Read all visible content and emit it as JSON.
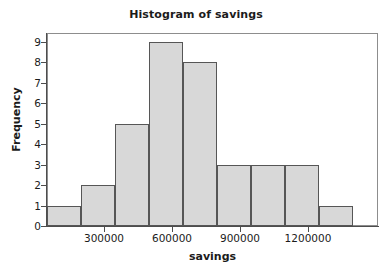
{
  "chart_data": {
    "type": "bar",
    "title": "Histogram of savings",
    "subtitle": "",
    "xlabel": "savings",
    "ylabel": "Frequency",
    "grid": false,
    "legend": null,
    "legend_position": "none",
    "bin_width": 150000,
    "bin_edges": [
      50000,
      200000,
      350000,
      500000,
      650000,
      800000,
      950000,
      1100000,
      1250000,
      1400000
    ],
    "categories": [
      "50000-200000",
      "200000-350000",
      "350000-500000",
      "500000-650000",
      "650000-800000",
      "800000-950000",
      "950000-1100000",
      "1100000-1250000",
      "1250000-1400000"
    ],
    "values": [
      1,
      2,
      5,
      9,
      8,
      3,
      3,
      3,
      1
    ],
    "bar_color": "#d8d8d8",
    "bar_edge_color": "#565656",
    "xlim": [
      50000,
      1510000
    ],
    "ylim": [
      0,
      9.5
    ],
    "x_ticks": [
      300000,
      600000,
      900000,
      1200000
    ],
    "x_tick_labels": [
      "300000",
      "600000",
      "900000",
      "1200000"
    ],
    "y_ticks": [
      0,
      1,
      2,
      3,
      4,
      5,
      6,
      7,
      8,
      9
    ],
    "y_tick_labels": [
      "0",
      "1",
      "2",
      "3",
      "4",
      "5",
      "6",
      "7",
      "8",
      "9"
    ]
  },
  "figure": {
    "background_color": "#ffffff",
    "frame_color": "#8d8d8d",
    "axis_color": "#4d4d4d",
    "text_color": "#1b1b1b"
  }
}
